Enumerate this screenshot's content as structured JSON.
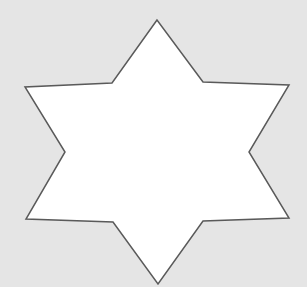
{
  "canvas": {
    "width": 307,
    "height": 287,
    "background": "#e5e5e5"
  },
  "shape": {
    "type": "six-pointed-star",
    "fill": "#ffffff",
    "stroke": "#5a5a5a",
    "stroke_width": 1.5,
    "points": "157,20 112,83 25,87 65,152 26,219 113,222 158,284 203,221 289,218 249,152 289,85 203,82"
  }
}
